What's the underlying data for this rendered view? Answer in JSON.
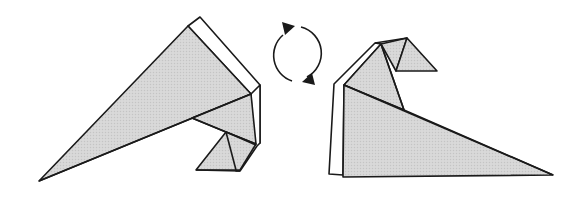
{
  "diagram": {
    "type": "origami-fold-step",
    "colors": {
      "paper_colored": "#d4d4d4",
      "paper_white": "#ffffff",
      "line": "#1a1a1a",
      "background": "#ffffff"
    },
    "figures": [
      {
        "name": "before-turn-over",
        "view": "front"
      },
      {
        "name": "after-turn-over",
        "view": "back"
      }
    ],
    "symbol": {
      "name": "turn-over-arrows",
      "meaning": "turn model over"
    }
  }
}
